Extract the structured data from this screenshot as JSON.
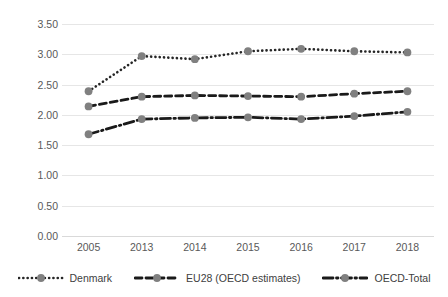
{
  "chart_data": {
    "type": "line",
    "title": "",
    "xlabel": "",
    "ylabel": "",
    "categories": [
      "2005",
      "2013",
      "2014",
      "2015",
      "2016",
      "2017",
      "2018"
    ],
    "ylim": [
      0.0,
      3.5
    ],
    "y_ticks": [
      "0.00",
      "0.50",
      "1.00",
      "1.50",
      "2.00",
      "2.50",
      "3.00",
      "3.50"
    ],
    "y_tick_values": [
      0.0,
      0.5,
      1.0,
      1.5,
      2.0,
      2.5,
      3.0,
      3.5
    ],
    "grid": true,
    "legend_position": "bottom",
    "series": [
      {
        "name": "Denmark",
        "style": "dotted",
        "color": "#262626",
        "marker_color": "#808080",
        "values": [
          2.39,
          2.97,
          2.92,
          3.05,
          3.09,
          3.05,
          3.03
        ]
      },
      {
        "name": "EU28 (OECD estimates)",
        "style": "dashed",
        "color": "#1a1a1a",
        "marker_color": "#808080",
        "values": [
          2.14,
          2.3,
          2.32,
          2.31,
          2.3,
          2.35,
          2.39
        ]
      },
      {
        "name": "OECD-Total",
        "style": "dashdot",
        "color": "#1a1a1a",
        "marker_color": "#808080",
        "values": [
          1.68,
          1.93,
          1.95,
          1.96,
          1.93,
          1.98,
          2.05
        ]
      }
    ]
  },
  "legend": {
    "items": [
      {
        "label": "Denmark"
      },
      {
        "label": "EU28 (OECD estimates)"
      },
      {
        "label": "OECD-Total"
      }
    ]
  },
  "colors": {
    "gridline": "#e6e6e6",
    "tick_text": "#595959",
    "legend_text": "#404040",
    "marker": "#808080",
    "line": "#1a1a1a",
    "background": "#ffffff"
  }
}
